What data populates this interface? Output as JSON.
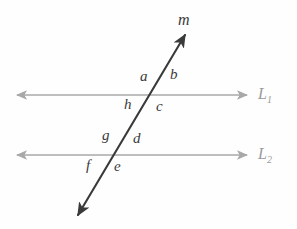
{
  "figure": {
    "type": "geometry-diagram",
    "background_color": "#fefefe",
    "parallel_line_color": "#a8a8a8",
    "transversal_color": "#3a3a3a",
    "label_color": "#3a3a3a",
    "line_label_color": "#9a9a9a"
  },
  "lines": {
    "parallel": [
      {
        "id": "L1",
        "label_base": "L",
        "label_sub": "1",
        "y": 95,
        "x_start": 17,
        "x_end": 247,
        "arrow_start": true,
        "arrow_end": true
      },
      {
        "id": "L2",
        "label_base": "L",
        "label_sub": "2",
        "y": 155,
        "x_start": 17,
        "x_end": 247,
        "arrow_start": true,
        "arrow_end": true
      }
    ],
    "transversal": {
      "id": "m",
      "label": "m",
      "x_start": 78,
      "y_start": 215,
      "x_end": 185,
      "y_end": 35,
      "arrow_start": true,
      "arrow_end": true
    }
  },
  "intersections": [
    {
      "id": "upper",
      "x": 155,
      "y": 95,
      "line": "L1"
    },
    {
      "id": "lower",
      "x": 118,
      "y": 155,
      "line": "L2"
    }
  ],
  "angle_labels": [
    {
      "id": "a",
      "text": "a",
      "x": 140,
      "y": 69,
      "position": "upper-intersection-top-left"
    },
    {
      "id": "b",
      "text": "b",
      "x": 170,
      "y": 67,
      "position": "upper-intersection-top-right"
    },
    {
      "id": "c",
      "text": "c",
      "x": 156,
      "y": 99,
      "position": "upper-intersection-bottom-right"
    },
    {
      "id": "h",
      "text": "h",
      "x": 124,
      "y": 97,
      "position": "upper-intersection-bottom-left"
    },
    {
      "id": "g",
      "text": "g",
      "x": 102,
      "y": 128,
      "position": "lower-intersection-top-left"
    },
    {
      "id": "d",
      "text": "d",
      "x": 133,
      "y": 131,
      "position": "lower-intersection-top-right"
    },
    {
      "id": "e",
      "text": "e",
      "x": 114,
      "y": 159,
      "position": "lower-intersection-bottom-right"
    },
    {
      "id": "f",
      "text": "f",
      "x": 86,
      "y": 158,
      "position": "lower-intersection-bottom-left"
    }
  ],
  "line_labels": [
    {
      "id": "L1-label",
      "base": "L",
      "sub": "1",
      "x": 258,
      "y": 86
    },
    {
      "id": "L2-label",
      "base": "L",
      "sub": "2",
      "x": 258,
      "y": 146
    }
  ],
  "transversal_label": {
    "id": "m-label",
    "text": "m",
    "x": 178,
    "y": 12
  }
}
